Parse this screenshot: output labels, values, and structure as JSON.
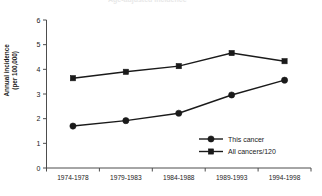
{
  "cropped_header": "Age-adjusted incidence",
  "chart_data": {
    "type": "line",
    "title": "",
    "xlabel": "",
    "ylabel_lines": [
      "Annual incidence",
      "(per 100,000)"
    ],
    "ylabel": "Annual incidence (per 100,000)",
    "categories": [
      "1974-1978",
      "1979-1983",
      "1984-1988",
      "1989-1993",
      "1994-1998"
    ],
    "ylim": [
      0,
      6
    ],
    "yticks": [
      "0",
      "1",
      "2",
      "3",
      "4",
      "5",
      "6"
    ],
    "ytick_values": [
      0,
      1,
      2,
      3,
      4,
      5,
      6
    ],
    "grid": false,
    "legend_position": "inside-lower-right",
    "series": [
      {
        "name": "This cancer",
        "marker": "diamond",
        "color": "#1a1a1a",
        "values": [
          1.7,
          1.92,
          2.22,
          2.96,
          3.56
        ]
      },
      {
        "name": "All cancers/120",
        "marker": "square",
        "color": "#1a1a1a",
        "values": [
          3.64,
          3.9,
          4.13,
          4.66,
          4.33
        ]
      }
    ]
  }
}
